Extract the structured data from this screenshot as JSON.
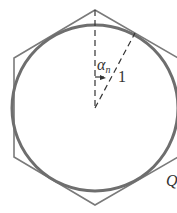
{
  "diagram": {
    "type": "geometry",
    "labels": {
      "angle": "α",
      "angle_subscript": "n",
      "radius": "1",
      "point": "Q"
    },
    "colors": {
      "stroke": "#777777",
      "circle": "#6e6e6e",
      "dash": "#333333"
    }
  }
}
